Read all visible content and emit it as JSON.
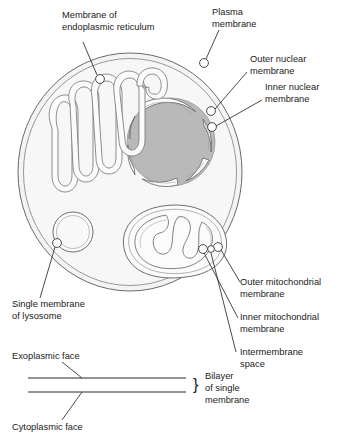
{
  "figure": {
    "background_color": "#ffffff",
    "line_color": "#555555",
    "cytoplasm_fill": "#f4f4f4",
    "nucleus_fill": "#b9b9b9",
    "organelle_fill": "#fbfbfb",
    "text_color": "#1a1a1a"
  },
  "labels": {
    "er": {
      "line1": "Membrane of",
      "line2": "endoplasmic reticulum"
    },
    "plasma_membrane": {
      "line1": "Plasma",
      "line2": "membrane"
    },
    "outer_nuclear": {
      "line1": "Outer nuclear",
      "line2": "membrane"
    },
    "inner_nuclear": {
      "line1": "Inner nuclear",
      "line2": "membrane"
    },
    "outer_mitochondrial": {
      "line1": "Outer mitochondrial",
      "line2": "membrane"
    },
    "inner_mitochondrial": {
      "line1": "Inner mitochondrial",
      "line2": "membrane"
    },
    "intermembrane_space": {
      "line1": "Intermembrane",
      "line2": "space"
    },
    "lysosome": {
      "line1": "Single membrane",
      "line2": "of lysosome"
    },
    "exoplasmic_face": {
      "line1": "Exoplasmic face"
    },
    "cytoplasmic_face": {
      "line1": "Cytoplasmic face"
    },
    "bilayer": {
      "line1": "Bilayer",
      "line2": "of single",
      "line3": "membrane"
    },
    "brace_glyph": "}"
  },
  "structures": {
    "cell": "cell-outline",
    "nucleus": "nucleus",
    "endoplasmic_reticulum": "endoplasmic-reticulum",
    "mitochondrion": "mitochondrion",
    "lysosome": "lysosome",
    "bilayer_diagram": "bilayer-diagram"
  }
}
